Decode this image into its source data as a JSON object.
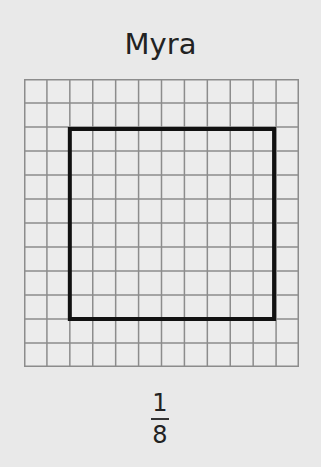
{
  "title": "Myra",
  "grid": {
    "columns": 12,
    "rows": 12,
    "line_color": "#8c8c8c",
    "background": "#ececec"
  },
  "shape": {
    "type": "rectangle",
    "start_col": 2,
    "start_row": 2,
    "end_col": 11,
    "end_row": 10,
    "stroke": "#111111"
  },
  "fraction": {
    "numerator": "1",
    "denominator": "8"
  }
}
